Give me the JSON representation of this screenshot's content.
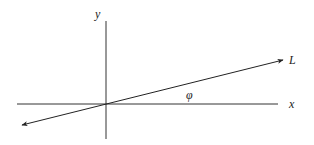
{
  "diagram": {
    "type": "coordinate-axes-with-line",
    "colors": {
      "line": "#222222",
      "axis": "#333333",
      "background": "#ffffff"
    },
    "labels": {
      "y_axis": "y",
      "x_axis": "x",
      "line": "L",
      "angle": "φ"
    },
    "elements": {
      "x_axis": {
        "x1": 17,
        "y1": 104,
        "x2": 278,
        "y2": 104
      },
      "y_axis": {
        "x1": 106,
        "y1": 21,
        "x2": 106,
        "y2": 139
      },
      "line_L": {
        "x1": 22,
        "y1": 125,
        "x2": 283,
        "y2": 60,
        "arrows": "both"
      }
    }
  }
}
